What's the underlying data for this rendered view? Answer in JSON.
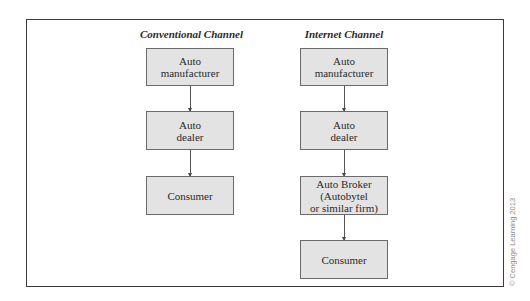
{
  "diagram": {
    "type": "flowchart",
    "columns": [
      {
        "title": "Conventional Channel",
        "nodes": [
          {
            "label": "Auto\nmanufacturer"
          },
          {
            "label": "Auto\ndealer"
          },
          {
            "label": "Consumer"
          }
        ],
        "edges": [
          {
            "from": 0,
            "to": 1
          },
          {
            "from": 1,
            "to": 2
          }
        ]
      },
      {
        "title": "Internet Channel",
        "nodes": [
          {
            "label": "Auto\nmanufacturer"
          },
          {
            "label": "Auto\ndealer"
          },
          {
            "label": "Auto Broker\n(Autobytel\nor similar firm)"
          },
          {
            "label": "Consumer"
          }
        ],
        "edges": [
          {
            "from": 0,
            "to": 1
          },
          {
            "from": 1,
            "to": 2
          },
          {
            "from": 2,
            "to": 3
          }
        ]
      }
    ]
  },
  "copyright": "© Cengage Learning 2013",
  "colors": {
    "box_fill": "#e3e3e3",
    "box_border": "#6a6a6a",
    "frame_border": "#3a3a3a",
    "text": "#2a2a2a"
  }
}
